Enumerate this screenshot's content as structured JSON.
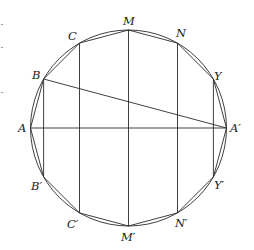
{
  "diagram": {
    "type": "inscribed-regular-12-gon-in-circle",
    "circle": {
      "cx": 128.5,
      "cy": 128,
      "r": 98
    },
    "colors": {
      "line": "#2a2a2a",
      "text": "#222222",
      "background": "#ffffff"
    },
    "points": {
      "A": {
        "label": "A",
        "x": 30.5,
        "y": 128
      },
      "B": {
        "label": "B",
        "x": 43.6,
        "y": 79
      },
      "C": {
        "label": "C",
        "x": 79.5,
        "y": 43.1
      },
      "M": {
        "label": "M",
        "x": 128.5,
        "y": 30
      },
      "N": {
        "label": "N",
        "x": 177.5,
        "y": 43.1
      },
      "Y": {
        "label": "Y",
        "x": 213.4,
        "y": 79
      },
      "A2": {
        "label": "A′",
        "x": 226.5,
        "y": 128
      },
      "Y2": {
        "label": "Y′",
        "x": 213.4,
        "y": 177
      },
      "N2": {
        "label": "N′",
        "x": 177.5,
        "y": 212.9
      },
      "M2": {
        "label": "M′",
        "x": 128.5,
        "y": 226
      },
      "C2": {
        "label": "C′",
        "x": 79.5,
        "y": 212.9
      },
      "B2": {
        "label": "B′",
        "x": 43.6,
        "y": 177
      }
    },
    "segments": [
      {
        "name": "chord-A-A2",
        "from": "A",
        "to": "A2"
      },
      {
        "name": "chord-B-A2",
        "from": "B",
        "to": "A2"
      },
      {
        "name": "chord-B-B2",
        "from": "B",
        "to": "B2"
      },
      {
        "name": "chord-C-C2",
        "from": "C",
        "to": "C2"
      },
      {
        "name": "chord-M-M2",
        "from": "M",
        "to": "M2"
      },
      {
        "name": "chord-N-N2",
        "from": "N",
        "to": "N2"
      },
      {
        "name": "chord-Y-Y2",
        "from": "Y",
        "to": "Y2"
      }
    ],
    "labels": {
      "A": "A",
      "B": "B",
      "C": "C",
      "M": "M",
      "N": "N",
      "Y": "Y",
      "A2": "A′",
      "Y2": "Y′",
      "N2": "N′",
      "M2": "M′",
      "C2": "C′",
      "B2": "B′"
    }
  }
}
